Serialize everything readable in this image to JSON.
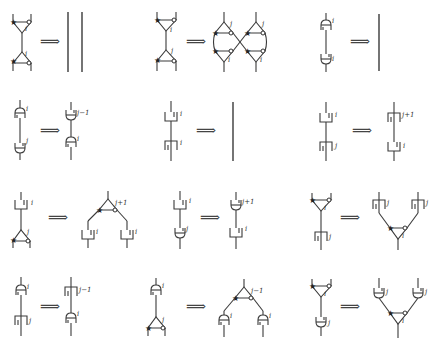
{
  "figure": {
    "arrow_symbol": "⟹",
    "rules": [
      {
        "id": "r1",
        "lhs": "cup-triangle over cap-triangle (i, i)",
        "rhs": "two parallel wires",
        "labels": [
          "i",
          "i"
        ]
      },
      {
        "id": "r2",
        "lhs": "triangle i over triangle j",
        "rhs": "crossed pair of triangle vertices",
        "labels": [
          "i",
          "j",
          "j",
          "j",
          "i",
          "i"
        ]
      },
      {
        "id": "r3",
        "lhs": "cap i over cup i",
        "rhs": "single wire",
        "labels": [
          "i",
          "i"
        ]
      },
      {
        "id": "r4",
        "lhs": "cap i over cup j",
        "rhs": "cup j−1 over cap i",
        "labels": [
          "i",
          "j",
          "j−1",
          "i"
        ]
      },
      {
        "id": "r5",
        "lhs": "bracket i over inverse bracket i",
        "rhs": "single wire",
        "labels": [
          "i",
          "i"
        ]
      },
      {
        "id": "r6",
        "lhs": "bracket i over bracket j",
        "rhs": "bracket j+1 over bracket i",
        "labels": [
          "i",
          "j",
          "j+1",
          "i"
        ]
      },
      {
        "id": "r7",
        "lhs": "bracket i over triangle j",
        "rhs": "triangle j+1 splitting to two brackets i",
        "labels": [
          "i",
          "j",
          "j+1",
          "i",
          "i"
        ]
      },
      {
        "id": "r8",
        "lhs": "bracket i over cup j",
        "rhs": "cup j+1 over bracket i",
        "labels": [
          "i",
          "j",
          "j+1",
          "i"
        ]
      },
      {
        "id": "r9",
        "lhs": "triangle i over bracket j",
        "rhs": "two brackets j merging into triangle i",
        "labels": [
          "i",
          "j",
          "j",
          "j",
          "i"
        ]
      },
      {
        "id": "r10",
        "lhs": "cap i over bracket j",
        "rhs": "bracket j−1 over cap i",
        "labels": [
          "i",
          "j",
          "j−1",
          "i"
        ]
      },
      {
        "id": "r11",
        "lhs": "cap i over triangle j",
        "rhs": "triangle j−1 splitting to two caps i",
        "labels": [
          "i",
          "j",
          "j−1",
          "i",
          "i"
        ]
      },
      {
        "id": "r12",
        "lhs": "triangle i over cup j",
        "rhs": "two cups j merging into triangle i",
        "labels": [
          "i",
          "j",
          "j",
          "j",
          "i"
        ]
      }
    ],
    "text": {
      "i": "i",
      "j": "j",
      "jm1": "j−1",
      "jp1": "j+1",
      "star": "★",
      "arrow": "⟹"
    }
  }
}
